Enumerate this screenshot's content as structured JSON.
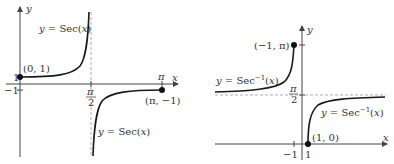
{
  "left_graph": {
    "title": "Graph of y = Sec(x)",
    "axis_x_label": "x",
    "axis_y_label": "y",
    "curve_upper_label_prefix": "y = Sec(",
    "curve_upper_label_var": "x",
    "curve_upper_label_suffix": ")",
    "curve_lower_label_prefix": "y = Sec(",
    "curve_lower_label_var": "x",
    "curve_lower_label_suffix": ")",
    "point_start_label": "(0, 1)",
    "point_end_label": "(π, −1)",
    "tick_y_one": "1",
    "tick_y_neg_one": "−1",
    "tick_x_pi": "π",
    "tick_x_half_pi_num": "π",
    "tick_x_half_pi_den": "2",
    "asymptote": "x = π/2"
  },
  "right_graph": {
    "title": "Graph of y = Sec⁻¹(x)",
    "axis_x_label": "x",
    "axis_y_label": "y",
    "curve_left_label_prefix": "y = Sec",
    "curve_left_label_sup": "−1",
    "curve_left_label_suffix": "(x)",
    "curve_right_label_prefix": "y = Sec",
    "curve_right_label_sup": "−1",
    "curve_right_label_suffix": "(x)",
    "point_top_label": "(−1, π)",
    "point_bottom_label": "(1, 0)",
    "tick_y_half_pi_num": "π",
    "tick_y_half_pi_den": "2",
    "tick_x_neg_one": "−1",
    "tick_x_one": "1",
    "asymptote": "y = π/2"
  },
  "colors": {
    "axis": "#444444",
    "curve": "#1a1a1a",
    "dashed": "#999999",
    "point": "#111111"
  }
}
